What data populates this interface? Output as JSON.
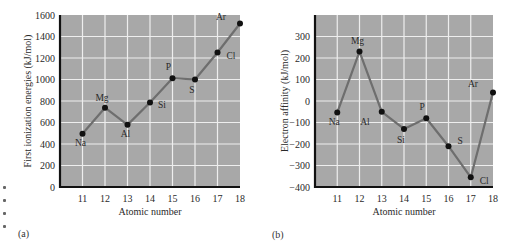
{
  "figure": {
    "panels": [
      {
        "label": "(a)"
      },
      {
        "label": "(b)"
      }
    ],
    "colors": {
      "plot_background": "#a8a8a8",
      "grid": "#eeeeee",
      "line": "#6e6e6e",
      "marker": "#111111",
      "axis": "#111111"
    }
  },
  "chart_data": [
    {
      "type": "line",
      "panel": "(a)",
      "title": "",
      "xlabel": "Atomic number",
      "ylabel": "First ionization energies (kJ/mol)",
      "x": [
        11,
        12,
        13,
        14,
        15,
        16,
        17,
        18
      ],
      "x_ticks": [
        "11",
        "12",
        "13",
        "14",
        "15",
        "16",
        "17",
        "18"
      ],
      "y_ticks": [
        "0",
        "200",
        "400",
        "600",
        "800",
        "1000",
        "1200",
        "1400",
        "1600"
      ],
      "xlim": [
        10,
        18
      ],
      "ylim": [
        0,
        1600
      ],
      "grid": true,
      "legend": null,
      "series": [
        {
          "name": "First ionization energy",
          "values": [
            496,
            738,
            578,
            786,
            1012,
            1000,
            1251,
            1521
          ],
          "point_labels": [
            "Na",
            "Mg",
            "Al",
            "Si",
            "P",
            "S",
            "Cl",
            "Ar"
          ]
        }
      ]
    },
    {
      "type": "line",
      "panel": "(b)",
      "title": "",
      "xlabel": "Atomic number",
      "ylabel": "Electron affinity (kJ/mol)",
      "x": [
        11,
        12,
        13,
        14,
        15,
        16,
        17,
        18
      ],
      "x_ticks": [
        "11",
        "12",
        "13",
        "14",
        "15",
        "16",
        "17",
        "18"
      ],
      "y_ticks": [
        "300",
        "200",
        "100",
        "0",
        "-100",
        "-200",
        "-300",
        "-400"
      ],
      "xlim": [
        10,
        18
      ],
      "ylim": [
        -400,
        400
      ],
      "grid": true,
      "legend": null,
      "series": [
        {
          "name": "Electron affinity",
          "values": [
            -53,
            230,
            -50,
            -130,
            -80,
            -210,
            -355,
            40
          ],
          "point_labels": [
            "Na",
            "Mg",
            "Al",
            "Si",
            "P",
            "S",
            "Cl",
            "Ar"
          ]
        }
      ]
    }
  ]
}
